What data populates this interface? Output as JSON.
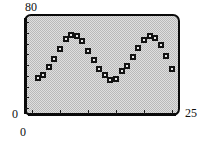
{
  "chart_data": {
    "type": "scatter",
    "title": "",
    "subtitle": "",
    "xlabel": "",
    "ylabel": "",
    "xlim": [
      0,
      25
    ],
    "ylim": [
      0,
      80
    ],
    "grid": false,
    "legend": null,
    "x_tick_labels": [
      "0",
      "25"
    ],
    "y_tick_labels": [
      "0",
      "80"
    ],
    "marker": "dotted-square",
    "marker_color": "#121212",
    "plot_background": "#b9b9b9",
    "frame_color": "#0a0a0a",
    "n_points": 25,
    "x": [
      1,
      2,
      3,
      4,
      5,
      6,
      7,
      8,
      9,
      10,
      11,
      12,
      13,
      14,
      15,
      16,
      17,
      18,
      19,
      20,
      21,
      22,
      23,
      24,
      25
    ],
    "y": [
      28,
      31,
      38,
      46,
      55,
      64,
      68,
      67,
      62,
      53,
      45,
      36,
      31,
      26,
      27,
      34,
      39,
      47,
      56,
      63,
      67,
      65,
      59,
      48,
      36
    ],
    "points": [
      {
        "x": 1,
        "y": 28
      },
      {
        "x": 2,
        "y": 31
      },
      {
        "x": 3,
        "y": 38
      },
      {
        "x": 4,
        "y": 46
      },
      {
        "x": 5,
        "y": 55
      },
      {
        "x": 6,
        "y": 64
      },
      {
        "x": 7,
        "y": 68
      },
      {
        "x": 8,
        "y": 67
      },
      {
        "x": 9,
        "y": 62
      },
      {
        "x": 10,
        "y": 53
      },
      {
        "x": 11,
        "y": 45
      },
      {
        "x": 12,
        "y": 36
      },
      {
        "x": 13,
        "y": 31
      },
      {
        "x": 14,
        "y": 26
      },
      {
        "x": 15,
        "y": 27
      },
      {
        "x": 16,
        "y": 34
      },
      {
        "x": 17,
        "y": 39
      },
      {
        "x": 18,
        "y": 47
      },
      {
        "x": 19,
        "y": 56
      },
      {
        "x": 20,
        "y": 63
      },
      {
        "x": 21,
        "y": 67
      },
      {
        "x": 22,
        "y": 65
      },
      {
        "x": 23,
        "y": 59
      },
      {
        "x": 24,
        "y": 48
      },
      {
        "x": 25,
        "y": 36
      }
    ],
    "x_ticks": [
      0,
      5,
      10,
      15,
      20,
      25
    ],
    "y_ticks": [
      0,
      10,
      20,
      30,
      40,
      50,
      60,
      70,
      80
    ]
  },
  "axes": {
    "y_max_label": "80",
    "y_min_label": "0",
    "x_min_label": "0",
    "x_max_label": "25"
  }
}
